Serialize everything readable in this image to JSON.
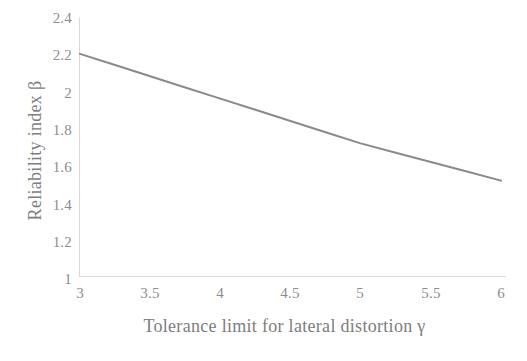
{
  "chart_data": {
    "type": "line",
    "title": "",
    "xlabel": "Tolerance limit for lateral distortion γ",
    "ylabel": "Reliability index β",
    "xlim": [
      3,
      6
    ],
    "ylim": [
      1,
      2.4
    ],
    "xticks": [
      "3",
      "3.5",
      "4",
      "4.5",
      "5",
      "5.5",
      "6"
    ],
    "xtick_values": [
      3,
      3.5,
      4,
      4.5,
      5,
      5.5,
      6
    ],
    "yticks": [
      "1",
      "1.2",
      "1.4",
      "1.6",
      "1.8",
      "2",
      "2.2",
      "2.4"
    ],
    "ytick_values": [
      1,
      1.2,
      1.4,
      1.6,
      1.8,
      2,
      2.2,
      2.4
    ],
    "grid": false,
    "legend": null,
    "series": [
      {
        "name": "Reliability index",
        "color": "#8a8a8a",
        "line_width": 2,
        "x": [
          3.0,
          3.25,
          3.5,
          3.75,
          4.0,
          4.25,
          4.5,
          4.75,
          5.0,
          5.25,
          5.5,
          5.75,
          6.0
        ],
        "values": [
          2.17,
          2.11,
          2.05,
          1.99,
          1.93,
          1.87,
          1.81,
          1.75,
          1.69,
          1.64,
          1.59,
          1.54,
          1.49
        ]
      }
    ]
  },
  "axes": {
    "x_title": "Tolerance limit for lateral distortion γ",
    "y_title": "Reliability index β",
    "axis_color": "#d9d9d9",
    "tick_label_color": "#8d8d8d",
    "title_color": "#7d7d7d",
    "background": "#ffffff"
  }
}
